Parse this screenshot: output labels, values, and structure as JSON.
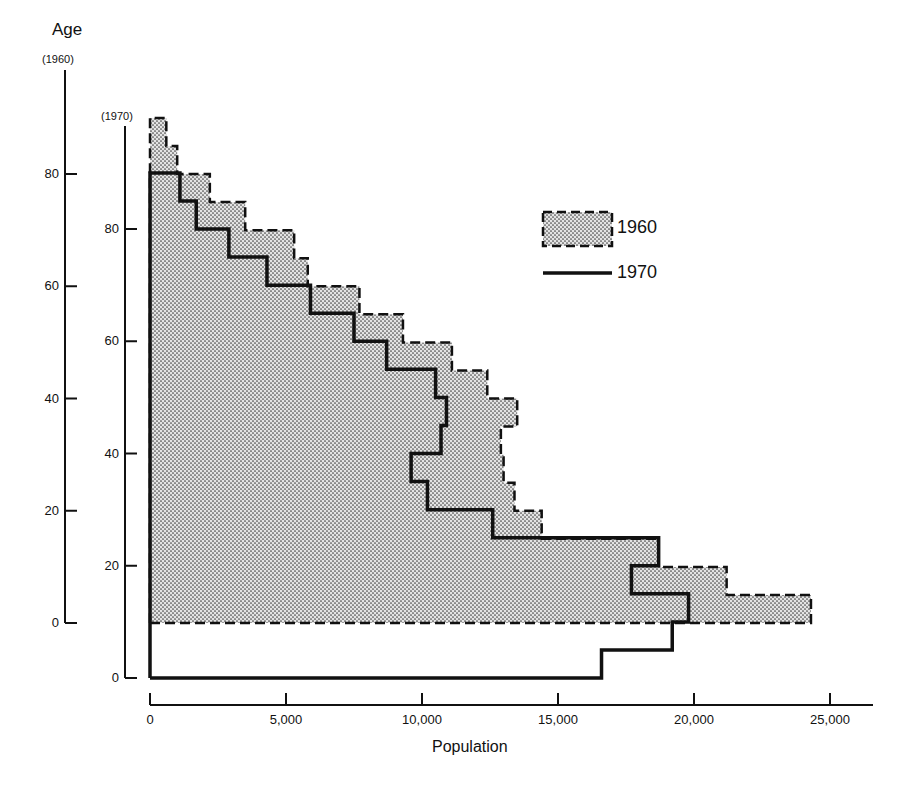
{
  "chart_data": {
    "type": "bar",
    "subtype": "population-pyramid-step-profile (half pyramid, horizontal steps)",
    "title": "",
    "xlabel": "Population",
    "ylabel": "Age",
    "xlim": [
      0,
      26500
    ],
    "x_ticks": [
      0,
      5000,
      10000,
      15000,
      20000,
      25000
    ],
    "x_tick_labels": [
      "0",
      "5,000",
      "10,000",
      "15,000",
      "20,000",
      "25,000"
    ],
    "y_axes": [
      {
        "name": "1960",
        "label": "(1960)",
        "ticks": [
          0,
          20,
          40,
          60,
          80
        ],
        "tick_labels": [
          "0",
          "20",
          "40",
          "60",
          "80"
        ]
      },
      {
        "name": "1970",
        "label": "(1970)",
        "ticks": [
          0,
          20,
          40,
          60,
          80
        ],
        "tick_labels": [
          "0",
          "20",
          "40",
          "60",
          "80"
        ]
      }
    ],
    "grid": false,
    "legend_position": "upper right",
    "age_groups": [
      "0-4",
      "5-9",
      "10-14",
      "15-19",
      "20-24",
      "25-29",
      "30-34",
      "35-39",
      "40-44",
      "45-49",
      "50-54",
      "55-59",
      "60-64",
      "65-69",
      "70-74",
      "75-79",
      "80-84",
      "85+"
    ],
    "series": [
      {
        "name": "1960",
        "style": "dashed outline, stippled fill",
        "values": [
          24300,
          21200,
          18700,
          14400,
          13400,
          13000,
          12900,
          13500,
          12400,
          11100,
          9300,
          7700,
          5800,
          5300,
          3500,
          2200,
          1000,
          600
        ]
      },
      {
        "name": "1970",
        "style": "solid outline",
        "values": [
          16600,
          19200,
          19800,
          17700,
          18700,
          12600,
          10200,
          9600,
          10700,
          10900,
          10500,
          8700,
          7500,
          5900,
          4300,
          2900,
          1700,
          1100
        ]
      }
    ],
    "legend": [
      {
        "label": "1960",
        "swatch": "dashed-stippled-box"
      },
      {
        "label": "1970",
        "swatch": "solid-line"
      }
    ],
    "note": "1960 age axis is offset upward by 10 years relative to 1970 axis, so cohorts align diagonally."
  },
  "labels": {
    "y_title": "Age",
    "axis_1960": "(1960)",
    "axis_1970": "(1970)",
    "x_title": "Population",
    "legend_1960": "1960",
    "legend_1970": "1970"
  },
  "colors": {
    "ink": "#111111",
    "stipple_fg": "#555555",
    "stipple_bg": "#e6e6e6",
    "background": "#ffffff"
  }
}
